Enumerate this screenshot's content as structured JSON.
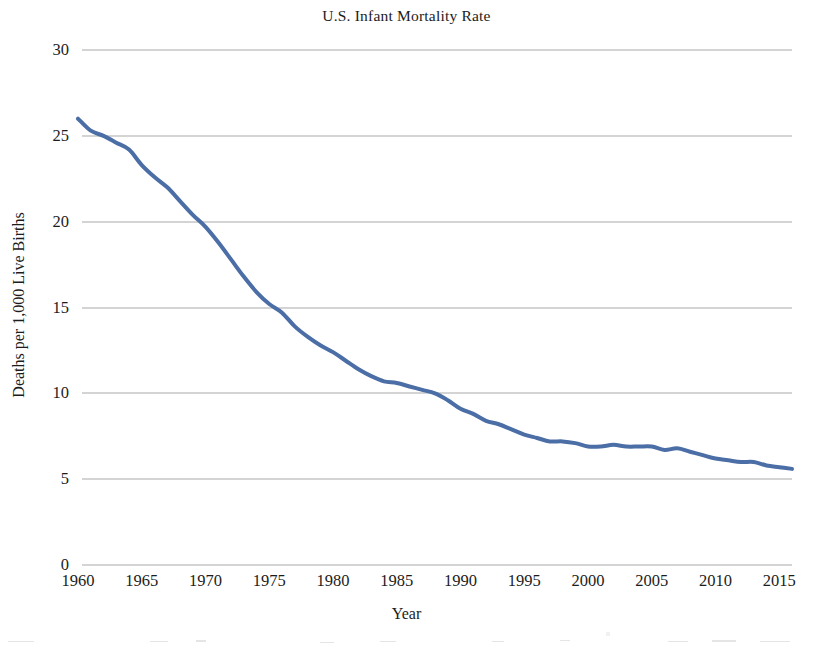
{
  "chart_data": {
    "type": "line",
    "title": "U.S. Infant Mortality Rate",
    "xlabel": "Year",
    "ylabel": "Deaths per 1,000 Live Births",
    "xlim": [
      1960,
      2016
    ],
    "ylim": [
      0,
      30
    ],
    "grid": true,
    "legend": "none",
    "y_ticks": [
      0,
      5,
      10,
      15,
      20,
      25,
      30
    ],
    "y_tick_labels": [
      "0",
      "5",
      "10",
      "15",
      "20",
      "25",
      "30"
    ],
    "x_ticks": [
      1960,
      1965,
      1970,
      1975,
      1980,
      1985,
      1990,
      1995,
      2000,
      2005,
      2010,
      2015
    ],
    "x_tick_labels": [
      "1960",
      "1965",
      "1970",
      "1975",
      "1980",
      "1985",
      "1990",
      "1995",
      "2000",
      "2005",
      "2010",
      "2015"
    ],
    "line_color": "#4a6ea5",
    "line_width": 4,
    "series": [
      {
        "name": "U.S. infant mortality rate",
        "x": [
          1960,
          1961,
          1962,
          1963,
          1964,
          1965,
          1966,
          1967,
          1968,
          1969,
          1970,
          1971,
          1972,
          1973,
          1974,
          1975,
          1976,
          1977,
          1978,
          1979,
          1980,
          1981,
          1982,
          1983,
          1984,
          1985,
          1986,
          1987,
          1988,
          1989,
          1990,
          1991,
          1992,
          1993,
          1994,
          1995,
          1996,
          1997,
          1998,
          1999,
          2000,
          2001,
          2002,
          2003,
          2004,
          2005,
          2006,
          2007,
          2008,
          2009,
          2010,
          2011,
          2012,
          2013,
          2014,
          2015,
          2016
        ],
        "values": [
          26.0,
          25.3,
          25.0,
          24.6,
          24.2,
          23.3,
          22.6,
          22.0,
          21.2,
          20.4,
          19.7,
          18.8,
          17.8,
          16.8,
          15.9,
          15.2,
          14.7,
          13.9,
          13.3,
          12.8,
          12.4,
          11.9,
          11.4,
          11.0,
          10.7,
          10.6,
          10.4,
          10.2,
          10.0,
          9.6,
          9.1,
          8.8,
          8.4,
          8.2,
          7.9,
          7.6,
          7.4,
          7.2,
          7.2,
          7.1,
          6.9,
          6.9,
          7.0,
          6.9,
          6.9,
          6.9,
          6.7,
          6.8,
          6.6,
          6.4,
          6.2,
          6.1,
          6.0,
          6.0,
          5.8,
          5.7,
          5.6
        ]
      }
    ]
  }
}
